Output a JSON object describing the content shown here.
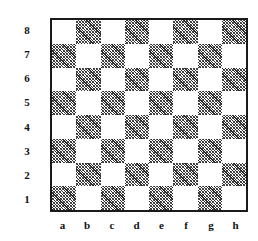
{
  "figure": {
    "name": "chessboard-diagram",
    "board_border_color": "#1a1a1a",
    "light_square_color": "#ffffff",
    "dark_square_fill": "hatched",
    "dark_square_color": "#2b2b2b",
    "background_color": "#ffffff",
    "label_color": "#111111"
  },
  "labels": {
    "ranks": [
      "8",
      "7",
      "6",
      "5",
      "4",
      "3",
      "2",
      "1"
    ],
    "files": [
      "a",
      "b",
      "c",
      "d",
      "e",
      "f",
      "g",
      "h"
    ]
  },
  "chart_data": {
    "type": "heatmap",
    "title": "",
    "xlabel": "",
    "ylabel": "",
    "categories": [
      "a",
      "b",
      "c",
      "d",
      "e",
      "f",
      "g",
      "h"
    ],
    "rows": [
      "8",
      "7",
      "6",
      "5",
      "4",
      "3",
      "2",
      "1"
    ],
    "legend": [
      "light",
      "dark"
    ],
    "grid": true,
    "note": "Standard chessboard coloring: a1 is dark, h1 is light. 1 = dark (hatched) square, 0 = light (white) square.",
    "values": [
      [
        0,
        1,
        0,
        1,
        0,
        1,
        0,
        1
      ],
      [
        1,
        0,
        1,
        0,
        1,
        0,
        1,
        0
      ],
      [
        0,
        1,
        0,
        1,
        0,
        1,
        0,
        1
      ],
      [
        1,
        0,
        1,
        0,
        1,
        0,
        1,
        0
      ],
      [
        0,
        1,
        0,
        1,
        0,
        1,
        0,
        1
      ],
      [
        1,
        0,
        1,
        0,
        1,
        0,
        1,
        0
      ],
      [
        0,
        1,
        0,
        1,
        0,
        1,
        0,
        1
      ],
      [
        1,
        0,
        1,
        0,
        1,
        0,
        1,
        0
      ]
    ]
  }
}
